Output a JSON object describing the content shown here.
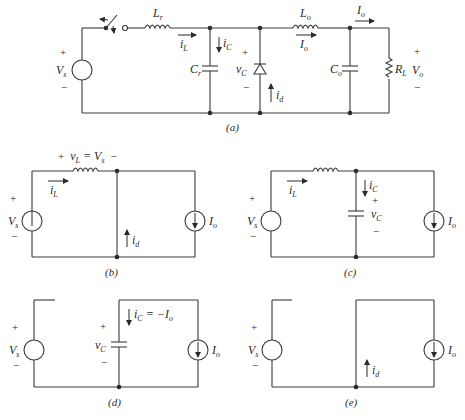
{
  "figure": {
    "panels": [
      {
        "id": "a",
        "caption": "(a)"
      },
      {
        "id": "b",
        "caption": "(b)"
      },
      {
        "id": "c",
        "caption": "(c)"
      },
      {
        "id": "d",
        "caption": "(d)"
      },
      {
        "id": "e",
        "caption": "(e)"
      }
    ],
    "labels": {
      "Vs_main": "V",
      "Vs_sub": "s",
      "Lr_main": "L",
      "Lr_sub": "r",
      "Lo_main": "L",
      "Lo_sub": "o",
      "Cr_main": "C",
      "Cr_sub": "r",
      "Co_main": "C",
      "Co_sub": "o",
      "RL_main": "R",
      "RL_sub": "L",
      "Vo_main": "V",
      "Vo_sub": "o",
      "Io_main": "I",
      "Io_sub": "o",
      "iL_main": "i",
      "iL_sub": "L",
      "iC_main": "i",
      "iC_sub": "C",
      "vC_main": "v",
      "vC_sub": "C",
      "id_main": "i",
      "id_sub": "d",
      "plus": "+",
      "minus": "−",
      "vL_eq": "v",
      "vL_sub": "L",
      "vL_rest": " = V",
      "vL_rest_sub": "s",
      "iC_eq_rest": " = −I",
      "iC_eq_sub": "o"
    }
  }
}
